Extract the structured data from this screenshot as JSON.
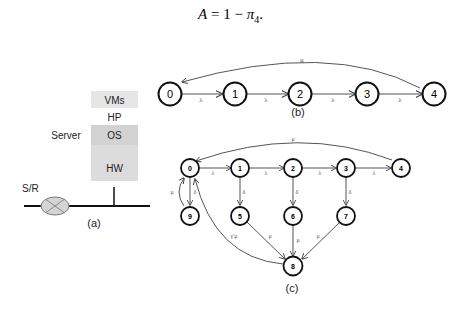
{
  "equation": {
    "lhs": "A",
    "rhs_prefix": "= 1 − ",
    "pi": "π",
    "subscript": "4",
    "suffix": "."
  },
  "panel_a": {
    "caption": "(a)",
    "server_label": "Server",
    "router_label": "S/R",
    "layers": [
      {
        "label": "VMs",
        "color": "#e6e6e6"
      },
      {
        "label": "HP",
        "color": "#ffffff"
      },
      {
        "label": "OS",
        "color": "#d2d2d2"
      },
      {
        "label": "HW",
        "color": "#dcdcdc"
      }
    ]
  },
  "panel_b": {
    "caption": "(b)",
    "nodes": [
      "0",
      "1",
      "2",
      "3",
      "4"
    ],
    "forward_label": "λ",
    "return_label": "μ"
  },
  "panel_c": {
    "caption": "(c)",
    "nodes": [
      "0",
      "1",
      "2",
      "3",
      "4",
      "5",
      "6",
      "7",
      "8",
      "9"
    ],
    "labels": {
      "lambda": "λ",
      "delta": "δ",
      "mu": "μ",
      "gamma_mu": "γ'μ"
    }
  }
}
